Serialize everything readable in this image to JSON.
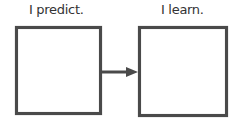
{
  "diagram": {
    "type": "flow",
    "nodes": [
      {
        "id": "predict",
        "label": "I predict.",
        "content": ""
      },
      {
        "id": "learn",
        "label": "I learn.",
        "content": ""
      }
    ],
    "edges": [
      {
        "from": "predict",
        "to": "learn",
        "style": "arrow"
      }
    ]
  },
  "colors": {
    "border": "#4a4a4a",
    "text": "#333333",
    "background": "#ffffff"
  }
}
